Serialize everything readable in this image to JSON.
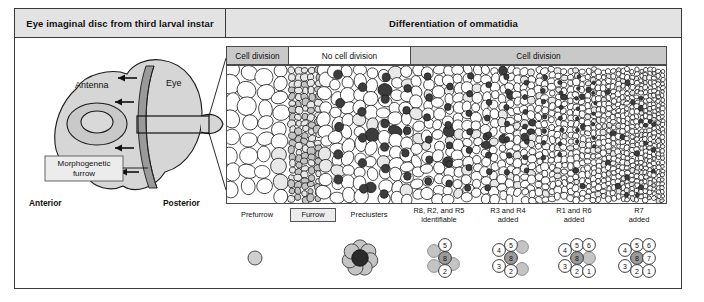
{
  "figure": {
    "header": {
      "left_title": "Eye imaginal disc from third larval instar",
      "right_title": "Differentiation of ommatidia"
    },
    "division_bands": [
      {
        "label": "Cell division",
        "shade": "gray"
      },
      {
        "label": "No cell division",
        "shade": "white"
      },
      {
        "label": "Cell division",
        "shade": "gray"
      }
    ],
    "disc_diagram": {
      "antenna_label": "Antenna",
      "eye_label": "Eye",
      "furrow_label": "Morphogenetic\nfurrow",
      "furrow_label_line1": "Morphogenetic",
      "furrow_label_line2": "furrow",
      "anterior_label": "Anterior",
      "posterior_label": "Posterior",
      "arrow_count": 4
    },
    "stage_labels": [
      {
        "text": "Prefurrow",
        "boxed": false,
        "lines": [
          "Prefurrow"
        ]
      },
      {
        "text": "Furrow",
        "boxed": true,
        "lines": [
          "Furrow"
        ]
      },
      {
        "text": "Preclusters",
        "boxed": false,
        "lines": [
          "Preclusters"
        ]
      },
      {
        "text": "R8, R2, and R5 identifiable",
        "boxed": false,
        "lines": [
          "R8, R2, and R5",
          "identifiable"
        ]
      },
      {
        "text": "R3 and R4 added",
        "boxed": false,
        "lines": [
          "R3 and R4",
          "added"
        ]
      },
      {
        "text": "R1 and R6 added",
        "boxed": false,
        "lines": [
          "R1 and R6",
          "added"
        ]
      },
      {
        "text": "R7 added",
        "boxed": false,
        "lines": [
          "R7",
          "added"
        ]
      }
    ],
    "clusters": [
      {
        "name": "prefurrow-single-cell",
        "cells": []
      },
      {
        "name": "precluster-rosette",
        "cells": []
      },
      {
        "name": "r8-r2-r5-cluster",
        "cells": [
          "5",
          "8",
          "2"
        ]
      },
      {
        "name": "r3-r4-cluster",
        "cells": [
          "4",
          "5",
          "8",
          "3",
          "2"
        ]
      },
      {
        "name": "r1-r6-cluster",
        "cells": [
          "4",
          "5",
          "6",
          "8",
          "3",
          "2",
          "1"
        ]
      },
      {
        "name": "r7-cluster-a",
        "cells": [
          "4",
          "5",
          "6",
          "8",
          "7",
          "3",
          "2",
          "1"
        ]
      },
      {
        "name": "r7-cluster-b",
        "cells": [
          "4",
          "5",
          "6",
          "8",
          "7",
          "3",
          "2",
          "1"
        ]
      }
    ],
    "colors": {
      "header_bg": "#e3e3e3",
      "band_gray": "#c9c9c9",
      "band_white": "#ffffff",
      "border": "#3a3a3a",
      "disc_fill": "#d6d6d6",
      "furrow_stripe": "#9a9a9a",
      "cell_light": "#e8e8e8",
      "cell_mid": "#c4c4c4",
      "cell_dark": "#3c3c3c"
    }
  }
}
